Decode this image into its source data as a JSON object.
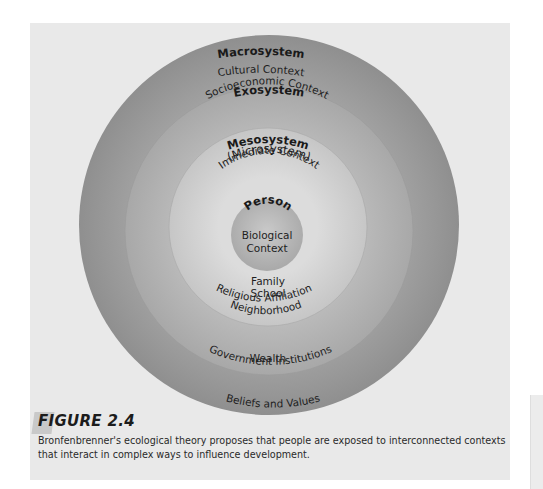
{
  "diagram": {
    "rings": [
      {
        "name": "Macrosystem",
        "context": "Cultural Context",
        "examples": [
          "Beliefs and Values"
        ],
        "color": "#9e9e9e"
      },
      {
        "name": "Exosystem",
        "context": "Socioeconomic Context",
        "examples": [
          "Government Institutions",
          "Wealth"
        ],
        "color": "#b3b3b3"
      },
      {
        "name": "Mesosystem",
        "name_line2": "(Microsystem)",
        "context": "Immediate Context",
        "examples": [
          "Family",
          "School",
          "Religious Affiliation",
          "Neighborhood"
        ],
        "color": "#d2d2d2"
      },
      {
        "name": "Person",
        "context_line1": "Biological",
        "context_line2": "Context",
        "color": "#b6b6b6"
      }
    ]
  },
  "figure": {
    "label": "FIGURE 2.4",
    "caption": "Bronfenbrenner's ecological theory proposes that people are exposed to interconnected contexts that interact in complex ways to influence development."
  }
}
